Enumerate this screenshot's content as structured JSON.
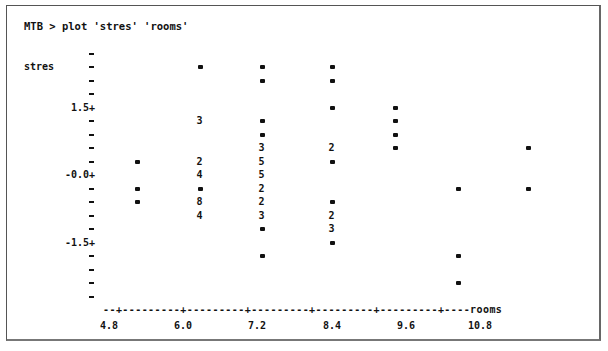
{
  "window": {
    "command_line": "MTB > plot 'stres' 'rooms'"
  },
  "chart_data": {
    "type": "scatter",
    "title": "MTB > plot 'stres' 'rooms'",
    "xlabel": "rooms",
    "ylabel": "stres",
    "x_ticks": [
      "4.8",
      "6.0",
      "7.2",
      "8.4",
      "9.6",
      "10.8"
    ],
    "y_ticks": [
      "1.5+",
      "-0.0+",
      "-1.5+"
    ],
    "xlim": [
      4.5,
      11.6
    ],
    "ylim": [
      -2.7,
      2.7
    ],
    "grid": false,
    "legend": "none",
    "note": "Character-plot; digits indicate number of overlapping points at a position, '*' indicates one point",
    "points": [
      {
        "x": 5.1,
        "y": 0.3,
        "count": 1,
        "symbol": "*"
      },
      {
        "x": 5.1,
        "y": -0.3,
        "count": 1,
        "symbol": "*"
      },
      {
        "x": 5.1,
        "y": -0.6,
        "count": 1,
        "symbol": "*"
      },
      {
        "x": 6.1,
        "y": 2.4,
        "count": 1,
        "symbol": "*"
      },
      {
        "x": 6.1,
        "y": 1.2,
        "count": 3,
        "symbol": "3"
      },
      {
        "x": 6.1,
        "y": 0.3,
        "count": 2,
        "symbol": "2"
      },
      {
        "x": 6.1,
        "y": 0.0,
        "count": 4,
        "symbol": "4"
      },
      {
        "x": 6.1,
        "y": -0.3,
        "count": 1,
        "symbol": "*"
      },
      {
        "x": 6.1,
        "y": -0.6,
        "count": 8,
        "symbol": "8"
      },
      {
        "x": 6.1,
        "y": -0.9,
        "count": 4,
        "symbol": "4"
      },
      {
        "x": 7.1,
        "y": 2.4,
        "count": 1,
        "symbol": "*"
      },
      {
        "x": 7.1,
        "y": 2.1,
        "count": 1,
        "symbol": "*"
      },
      {
        "x": 7.1,
        "y": 1.2,
        "count": 1,
        "symbol": "*"
      },
      {
        "x": 7.1,
        "y": 0.9,
        "count": 1,
        "symbol": "*"
      },
      {
        "x": 7.1,
        "y": 0.6,
        "count": 3,
        "symbol": "3"
      },
      {
        "x": 7.1,
        "y": 0.3,
        "count": 5,
        "symbol": "5"
      },
      {
        "x": 7.1,
        "y": 0.0,
        "count": 5,
        "symbol": "5"
      },
      {
        "x": 7.1,
        "y": -0.3,
        "count": 2,
        "symbol": "2"
      },
      {
        "x": 7.1,
        "y": -0.6,
        "count": 2,
        "symbol": "2"
      },
      {
        "x": 7.1,
        "y": -0.9,
        "count": 3,
        "symbol": "3"
      },
      {
        "x": 7.1,
        "y": -1.2,
        "count": 1,
        "symbol": "*"
      },
      {
        "x": 7.1,
        "y": -1.8,
        "count": 1,
        "symbol": "*"
      },
      {
        "x": 8.2,
        "y": 2.4,
        "count": 1,
        "symbol": "*"
      },
      {
        "x": 8.2,
        "y": 2.1,
        "count": 1,
        "symbol": "*"
      },
      {
        "x": 8.2,
        "y": 1.5,
        "count": 1,
        "symbol": "*"
      },
      {
        "x": 8.2,
        "y": 0.6,
        "count": 2,
        "symbol": "2"
      },
      {
        "x": 8.2,
        "y": 0.3,
        "count": 1,
        "symbol": "*"
      },
      {
        "x": 8.2,
        "y": -0.6,
        "count": 1,
        "symbol": "*"
      },
      {
        "x": 8.2,
        "y": -0.9,
        "count": 2,
        "symbol": "2"
      },
      {
        "x": 8.2,
        "y": -1.2,
        "count": 3,
        "symbol": "3"
      },
      {
        "x": 8.2,
        "y": -1.5,
        "count": 1,
        "symbol": "*"
      },
      {
        "x": 9.2,
        "y": 1.5,
        "count": 1,
        "symbol": "*"
      },
      {
        "x": 9.2,
        "y": 1.2,
        "count": 1,
        "symbol": "*"
      },
      {
        "x": 9.2,
        "y": 0.9,
        "count": 1,
        "symbol": "*"
      },
      {
        "x": 9.2,
        "y": 0.6,
        "count": 1,
        "symbol": "*"
      },
      {
        "x": 10.2,
        "y": -0.3,
        "count": 1,
        "symbol": "*"
      },
      {
        "x": 10.2,
        "y": -1.8,
        "count": 1,
        "symbol": "*"
      },
      {
        "x": 10.2,
        "y": -2.4,
        "count": 1,
        "symbol": "*"
      },
      {
        "x": 11.4,
        "y": 0.6,
        "count": 1,
        "symbol": "*"
      },
      {
        "x": 11.4,
        "y": -0.3,
        "count": 1,
        "symbol": "*"
      }
    ]
  },
  "axis": {
    "x_line": "--+---------+---------+---------+---------+---------+----",
    "x_name": "rooms",
    "y_name": "stres"
  }
}
